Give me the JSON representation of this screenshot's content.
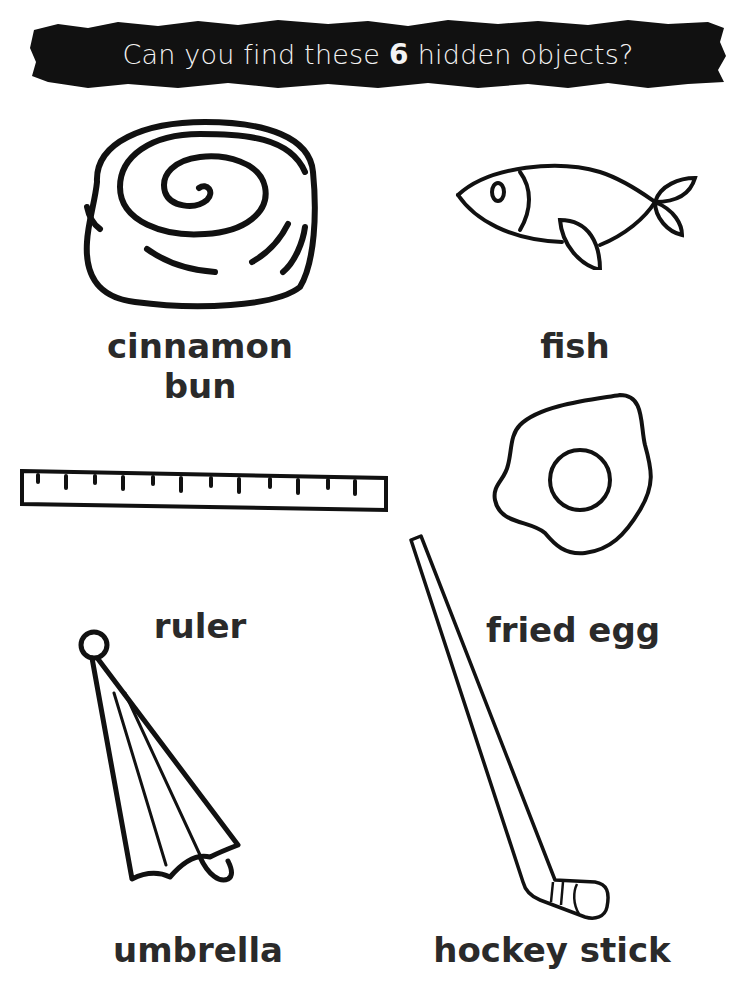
{
  "header": {
    "title_prefix": "Can you find these",
    "count": "6",
    "title_suffix": "hidden objects?"
  },
  "objects": [
    {
      "id": "cinnamon-bun",
      "label_line1": "cinnamon",
      "label_line2": "bun",
      "icon": "cinnamon-bun-icon"
    },
    {
      "id": "fish",
      "label": "fish",
      "icon": "fish-icon"
    },
    {
      "id": "ruler",
      "label": "ruler",
      "icon": "ruler-icon"
    },
    {
      "id": "fried-egg",
      "label": "fried egg",
      "icon": "fried-egg-icon"
    },
    {
      "id": "umbrella",
      "label": "umbrella",
      "icon": "umbrella-icon"
    },
    {
      "id": "hockey-stick",
      "label": "hockey stick",
      "icon": "hockey-stick-icon"
    }
  ],
  "colors": {
    "banner": "#111111",
    "banner_text": "#f4f4f4",
    "label_text": "#2a2a2a",
    "line_art": "#111111"
  }
}
